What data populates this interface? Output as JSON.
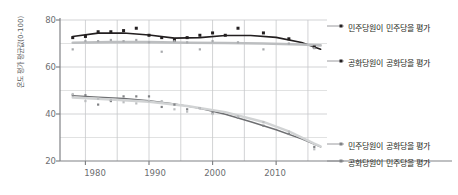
{
  "chart_data": {
    "type": "scatter",
    "title": "",
    "xlabel": "",
    "ylabel": "온도 평가 평균값(0-100)",
    "xlim": [
      1976,
      2018
    ],
    "ylim": [
      20,
      80
    ],
    "yticks": [
      20,
      40,
      60,
      80
    ],
    "xticks": [
      1980,
      1990,
      2000,
      2010
    ],
    "xtick_labels": [
      "1980",
      "1990",
      "2000",
      "2010"
    ],
    "ytick_labels": [
      "20",
      "40",
      "60",
      "80"
    ],
    "grid": true,
    "legend_position": "right",
    "series": [
      {
        "name": "민주당원이 민주당을 평가",
        "color": "#231f20",
        "marker": "square",
        "x": [
          1978,
          1980,
          1982,
          1984,
          1986,
          1988,
          1990,
          1992,
          1994,
          1996,
          1998,
          2000,
          2002,
          2004,
          2008,
          2012,
          2016
        ],
        "values": [
          72.5,
          73.0,
          75.0,
          75.0,
          75.5,
          76.5,
          73.5,
          72.5,
          71.5,
          72.5,
          73.5,
          74.5,
          73.5,
          76.5,
          74.5,
          72.0,
          68.5
        ]
      },
      {
        "name": "공화당원이 공화당을 평가",
        "color": "#a7a9ac",
        "marker": "square",
        "x": [
          1978,
          1980,
          1982,
          1984,
          1986,
          1988,
          1990,
          1992,
          1994,
          1996,
          1998,
          2000,
          2004,
          2008,
          2012,
          2016
        ],
        "values": [
          67.5,
          71.0,
          71.0,
          71.5,
          71.0,
          71.5,
          70.5,
          66.5,
          71.0,
          70.5,
          67.5,
          71.0,
          70.5,
          67.5,
          70.0,
          68.0
        ]
      },
      {
        "name": "민주당원이 공화당을 평가",
        "color": "#808285",
        "marker": "square",
        "x": [
          1978,
          1980,
          1982,
          1984,
          1986,
          1988,
          1990,
          1992,
          1994,
          1996,
          1998,
          2000,
          2004,
          2008,
          2012,
          2016
        ],
        "values": [
          48.0,
          48.0,
          44.0,
          45.5,
          47.5,
          47.5,
          47.5,
          43.0,
          44.0,
          42.0,
          42.5,
          40.5,
          38.5,
          35.0,
          31.5,
          26.0
        ]
      },
      {
        "name": "공화당원이 민주당을 평가",
        "color": "#bcbec0",
        "marker": "square",
        "x": [
          1978,
          1980,
          1982,
          1984,
          1986,
          1988,
          1990,
          1992,
          1994,
          1996,
          1998,
          2000,
          2004,
          2008,
          2012,
          2016
        ],
        "values": [
          48.5,
          45.5,
          46.5,
          46.0,
          45.0,
          44.5,
          45.5,
          45.5,
          42.0,
          41.0,
          42.5,
          40.0,
          39.0,
          36.5,
          32.5,
          25.0
        ]
      }
    ],
    "trend_lines": [
      {
        "name": "민주당원이 민주당을 평가 추세선",
        "color": "#231f20",
        "width": 1.6,
        "points": [
          [
            1978,
            73.0
          ],
          [
            1982,
            74.4
          ],
          [
            1986,
            74.5
          ],
          [
            1990,
            73.6
          ],
          [
            1994,
            72.3
          ],
          [
            1998,
            72.5
          ],
          [
            2002,
            73.4
          ],
          [
            2006,
            73.4
          ],
          [
            2010,
            72.6
          ],
          [
            2014,
            70.4
          ],
          [
            2017,
            67.6
          ]
        ]
      },
      {
        "name": "공화당원이 공화당을 평가 추세선",
        "color": "#bcbec0",
        "width": 2.6,
        "points": [
          [
            1978,
            70.3
          ],
          [
            1984,
            70.6
          ],
          [
            1990,
            70.6
          ],
          [
            1996,
            70.3
          ],
          [
            2002,
            70.2
          ],
          [
            2008,
            70.0
          ],
          [
            2014,
            69.6
          ],
          [
            2017,
            69.2
          ]
        ]
      },
      {
        "name": "민주당원이 공화당을 평가 추세선",
        "color": "#6d6e71",
        "width": 1.4,
        "points": [
          [
            1978,
            47.8
          ],
          [
            1982,
            47.2
          ],
          [
            1986,
            46.6
          ],
          [
            1990,
            45.7
          ],
          [
            1994,
            44.3
          ],
          [
            1998,
            42.4
          ],
          [
            2002,
            39.9
          ],
          [
            2006,
            36.7
          ],
          [
            2010,
            33.3
          ],
          [
            2014,
            29.4
          ],
          [
            2017,
            26.0
          ]
        ]
      },
      {
        "name": "공화당원이 민주당을 평가 추세선",
        "color": "#d1d3d4",
        "width": 2.4,
        "points": [
          [
            1978,
            47.0
          ],
          [
            1984,
            46.2
          ],
          [
            1990,
            45.2
          ],
          [
            1996,
            43.4
          ],
          [
            2002,
            40.8
          ],
          [
            2008,
            36.6
          ],
          [
            2012,
            32.6
          ],
          [
            2016,
            27.4
          ],
          [
            2017,
            26.2
          ]
        ]
      }
    ],
    "annotations": []
  },
  "legend": {
    "top": [
      {
        "label": "민주당원이 민주당을 평가",
        "marker_color": "#231f20"
      },
      {
        "label": "공화당원이 공화당을 평가",
        "marker_color": "#231f20"
      }
    ],
    "bottom": [
      {
        "label": "민주당원이 공화당을 평가",
        "marker_color": "#808285"
      },
      {
        "label": "공화당원이 민주당을 평가",
        "marker_color": "#808285"
      }
    ]
  }
}
